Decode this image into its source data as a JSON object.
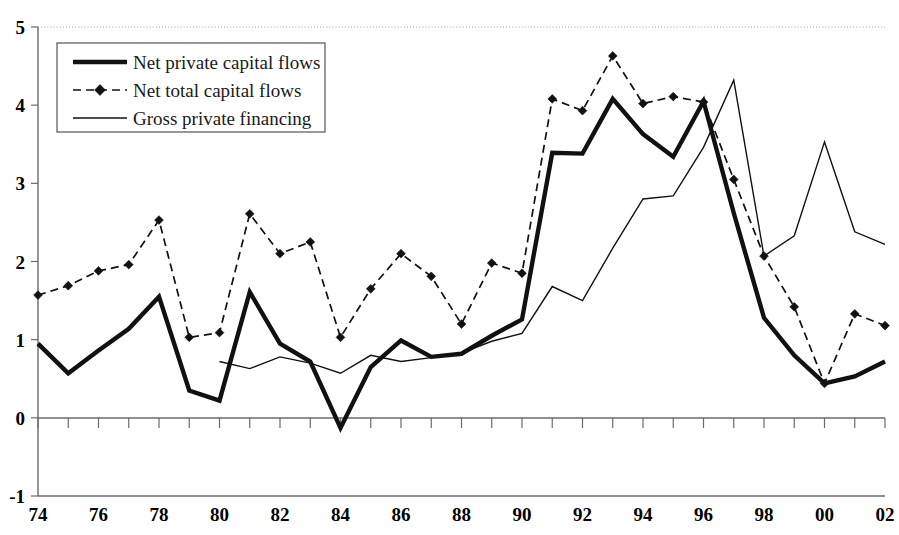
{
  "chart_data": {
    "type": "line",
    "title": "",
    "subtitle": "",
    "xlabel": "",
    "ylabel": "",
    "xlim": [
      1974,
      2002
    ],
    "ylim": [
      -1,
      5
    ],
    "yticks": [
      -1,
      0,
      1,
      2,
      3,
      4,
      5
    ],
    "ytick_labels": [
      "-1",
      "0",
      "1",
      "2",
      "3",
      "4",
      "5"
    ],
    "x": [
      1974,
      1975,
      1976,
      1977,
      1978,
      1979,
      1980,
      1981,
      1982,
      1983,
      1984,
      1985,
      1986,
      1987,
      1988,
      1989,
      1990,
      1991,
      1992,
      1993,
      1994,
      1995,
      1996,
      1997,
      1998,
      1999,
      2000,
      2001,
      2002
    ],
    "xtick_labels": [
      "74",
      "",
      "76",
      "",
      "78",
      "",
      "80",
      "",
      "82",
      "",
      "84",
      "",
      "86",
      "",
      "88",
      "",
      "90",
      "",
      "92",
      "",
      "94",
      "",
      "96",
      "",
      "98",
      "",
      "00",
      "",
      "02"
    ],
    "xticks_shown": [
      "74",
      "76",
      "78",
      "80",
      "82",
      "84",
      "86",
      "88",
      "90",
      "92",
      "94",
      "96",
      "98",
      "00",
      "02"
    ],
    "grid": "dotted-top-only",
    "legend_position": "top-left",
    "series": [
      {
        "name": "Net private capital flows",
        "style": "thick-solid",
        "marker": "none",
        "values": [
          0.95,
          0.57,
          0.86,
          1.14,
          1.55,
          0.35,
          0.22,
          1.61,
          0.95,
          0.72,
          -0.13,
          0.65,
          0.99,
          0.78,
          0.82,
          1.05,
          1.26,
          3.39,
          3.38,
          4.08,
          3.63,
          3.34,
          4.05,
          2.62,
          1.28,
          0.8,
          0.44,
          0.53,
          0.72
        ]
      },
      {
        "name": "Net total capital flows",
        "style": "dashed",
        "marker": "diamond",
        "values": [
          1.57,
          1.69,
          1.88,
          1.96,
          2.53,
          1.03,
          1.09,
          2.61,
          2.1,
          2.25,
          1.03,
          1.65,
          2.1,
          1.81,
          1.2,
          1.98,
          1.85,
          4.08,
          3.93,
          4.63,
          4.02,
          4.11,
          4.04,
          3.05,
          2.07,
          1.42,
          0.44,
          1.33,
          1.18
        ]
      },
      {
        "name": "Gross private financing",
        "style": "thin-solid",
        "marker": "none",
        "values": [
          null,
          null,
          null,
          null,
          null,
          null,
          0.72,
          0.63,
          0.78,
          0.7,
          0.57,
          0.8,
          0.72,
          0.77,
          0.83,
          0.98,
          1.08,
          1.68,
          1.5,
          2.17,
          2.8,
          2.84,
          3.46,
          4.32,
          2.07,
          2.33,
          3.53,
          2.38,
          2.22
        ]
      }
    ],
    "colors": {
      "line": "#111111",
      "axis": "#6b6b6b",
      "grid": "#9a9a9a",
      "background": "#ffffff"
    }
  },
  "legend": {
    "entries": [
      {
        "label": "Net private capital flows",
        "swatch": "thick-line-swatch"
      },
      {
        "label": "Net total capital flows",
        "swatch": "dashed-diamond-swatch"
      },
      {
        "label": "Gross private financing",
        "swatch": "thin-line-swatch"
      }
    ]
  }
}
